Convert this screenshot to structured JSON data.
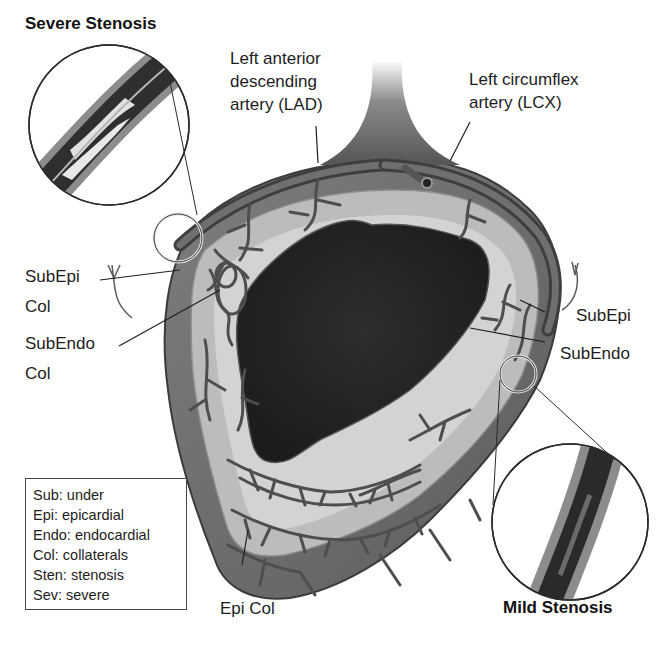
{
  "titles": {
    "severe": "Severe Stenosis",
    "mild": "Mild Stenosis"
  },
  "labels": {
    "lad": [
      "Left anterior",
      "descending",
      "artery (LAD)"
    ],
    "lcx": [
      "Left circumflex",
      "artery (LCX)"
    ],
    "subepi_col": [
      "SubEpi",
      "Col"
    ],
    "subendo_col": [
      "SubEndo",
      "Col"
    ],
    "subepi": "SubEpi",
    "subendo": "SubEndo",
    "epi_col": "Epi Col"
  },
  "legend": {
    "items": [
      "Sub: under",
      "Epi: epicardial",
      "Endo: endocardial",
      "Col: collaterals",
      "Sten: stenosis",
      "Sev: severe"
    ]
  },
  "colors": {
    "background": "#ffffff",
    "epicardium": "#6e6e6e",
    "myocardium": "#b9b9b9",
    "subendo_band": "#d4d4d4",
    "lumen": "#262626",
    "vessel": "#4a4a4a",
    "text": "#1d1d1d"
  }
}
